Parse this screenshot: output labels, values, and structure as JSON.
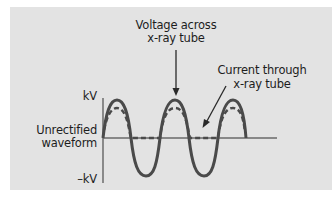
{
  "diagram": {
    "colors": {
      "background": "#e3e3e3",
      "stroke": "#4a4a4a",
      "text": "#1d1d1d"
    },
    "labels": {
      "voltage_line1": "Voltage across",
      "voltage_line2": "x-ray tube",
      "current_line1": "Current through",
      "current_line2": "x-ray tube",
      "axis_top": "kV",
      "axis_bottom": "–kV",
      "waveform_line1": "Unrectified",
      "waveform_line2": "waveform"
    },
    "series": [
      {
        "name": "Voltage across x-ray tube",
        "style": "solid",
        "shape": "sine, full cycles positive and negative",
        "cycles": 2.5
      },
      {
        "name": "Current through x-ray tube",
        "style": "dashed",
        "shape": "positive half-cycles only, flat at zero during negative half-cycles"
      }
    ]
  }
}
